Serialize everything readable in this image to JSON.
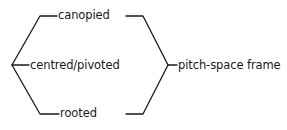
{
  "diagram": {
    "type": "bracket-grouping",
    "background_color": "#ffffff",
    "line_color": "#1a1a1a",
    "text_color": "#1a1a1a",
    "left_group": {
      "items": [
        {
          "id": "canopied",
          "label": "canopied"
        },
        {
          "id": "centred-pivoted",
          "label": "centred/pivoted"
        },
        {
          "id": "rooted",
          "label": "rooted"
        }
      ]
    },
    "right_group": {
      "items": [
        {
          "id": "pitch-space-frame",
          "label": "pitch-space frame"
        }
      ]
    }
  }
}
